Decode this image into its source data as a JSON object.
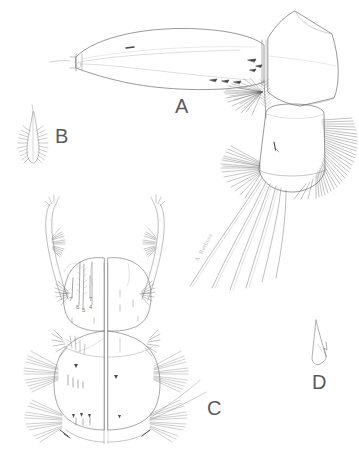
{
  "figure": {
    "background_color": "#ffffff",
    "ink_color": "#6b6b6b",
    "label_color": "#5a5a5a",
    "width": 359,
    "height": 460
  },
  "panels": [
    {
      "key": "A",
      "label": "A",
      "name": "siphon-and-anal-segment",
      "description": "Lateral view of larval siphon, anal segment with ventral brush and caudal setae",
      "label_x": 175,
      "label_y": 108
    },
    {
      "key": "B",
      "label": "B",
      "name": "lanceolate-scale",
      "description": "Single lanceolate fringed scale, enlarged",
      "label_x": 55,
      "label_y": 136
    },
    {
      "key": "C",
      "label": "C",
      "name": "head-and-thorax",
      "description": "Dorsal and ventral split view of head and thorax with antennae and setal tufts",
      "label_x": 207,
      "label_y": 408
    },
    {
      "key": "D",
      "label": "D",
      "name": "pecten-spine",
      "description": "Single pecten spine with basal denticles, enlarged",
      "label_x": 312,
      "label_y": 382
    }
  ],
  "seta_numbers": [
    {
      "text": "7",
      "x": 70,
      "y": 299
    },
    {
      "text": "6",
      "x": 77,
      "y": 307
    },
    {
      "text": "5",
      "x": 83,
      "y": 310
    },
    {
      "text": "7",
      "x": 90,
      "y": 299
    },
    {
      "text": "4",
      "x": 90,
      "y": 307
    }
  ],
  "artist_signature": {
    "text": "A. Barbosa",
    "x": 198,
    "y": 262,
    "rotation": -62
  }
}
